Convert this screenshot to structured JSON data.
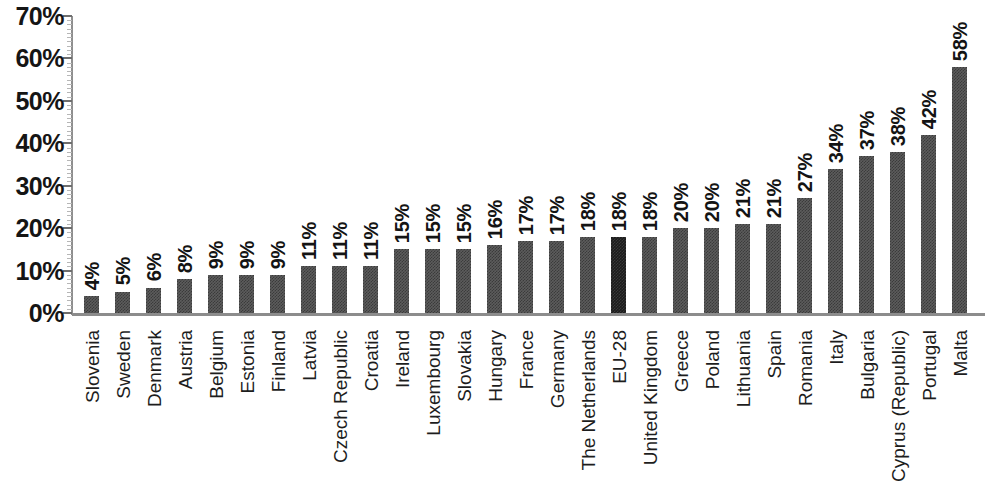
{
  "chart_data": {
    "type": "bar",
    "title": "",
    "subtitle": "",
    "xlabel": "",
    "ylabel": "",
    "ylim": [
      0,
      70
    ],
    "y_tick_step": 10,
    "y_minor_tick_step": 1,
    "grid": false,
    "legend": null,
    "value_suffix": "%",
    "highlight_category": "EU-28",
    "colors": {
      "bar": "#5c5c5c",
      "bar_highlight": "#1b1b1b",
      "axis": "#8c8c8c",
      "text": "#141414",
      "background": "#ffffff"
    },
    "y_tick_labels": [
      "0%",
      "10%",
      "20%",
      "30%",
      "40%",
      "50%",
      "60%",
      "70%"
    ],
    "y_tick_values": [
      0,
      10,
      20,
      30,
      40,
      50,
      60,
      70
    ],
    "categories": [
      "Slovenia",
      "Sweden",
      "Denmark",
      "Austria",
      "Belgium",
      "Estonia",
      "Finland",
      "Latvia",
      "Czech Republic",
      "Croatia",
      "Ireland",
      "Luxembourg",
      "Slovakia",
      "Hungary",
      "France",
      "Germany",
      "The Netherlands",
      "EU-28",
      "United Kingdom",
      "Greece",
      "Poland",
      "Lithuania",
      "Spain",
      "Romania",
      "Italy",
      "Bulgaria",
      "Cyprus (Republic)",
      "Portugal",
      "Malta"
    ],
    "values": [
      4,
      5,
      6,
      8,
      9,
      9,
      9,
      11,
      11,
      11,
      15,
      15,
      15,
      16,
      17,
      17,
      18,
      18,
      18,
      20,
      20,
      21,
      21,
      27,
      34,
      37,
      38,
      42,
      58
    ],
    "data_labels": [
      "4%",
      "5%",
      "6%",
      "8%",
      "9%",
      "9%",
      "9%",
      "11%",
      "11%",
      "11%",
      "15%",
      "15%",
      "15%",
      "16%",
      "17%",
      "17%",
      "18%",
      "18%",
      "18%",
      "20%",
      "20%",
      "21%",
      "21%",
      "27%",
      "34%",
      "37%",
      "38%",
      "42%",
      "58%"
    ]
  }
}
